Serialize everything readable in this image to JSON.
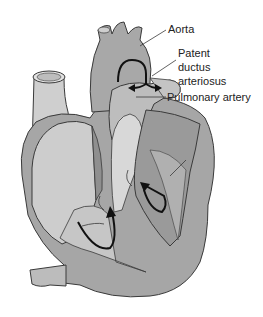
{
  "diagram": {
    "labels": {
      "aorta": "Aorta",
      "pda_line1": "Patent",
      "pda_line2": "ductus",
      "pda_line3": "arteriosus",
      "pulmonary_artery": "Pulmonary artery"
    },
    "colors": {
      "outline": "#3a3a3a",
      "dark_tissue": "#8f8f8f",
      "mid_tissue": "#a9a9a9",
      "light_chamber": "#c8c8c8",
      "pale": "#dcdcdc",
      "arrow": "#111111",
      "background": "#ffffff"
    }
  }
}
